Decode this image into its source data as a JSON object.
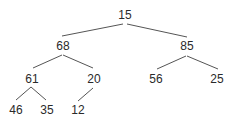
{
  "diagram": {
    "type": "binary-tree",
    "nodes": [
      {
        "id": "n15",
        "label": "15",
        "x": 125,
        "y": 15
      },
      {
        "id": "n68",
        "label": "68",
        "x": 63,
        "y": 46
      },
      {
        "id": "n85",
        "label": "85",
        "x": 187,
        "y": 46
      },
      {
        "id": "n61",
        "label": "61",
        "x": 32,
        "y": 79
      },
      {
        "id": "n20",
        "label": "20",
        "x": 94,
        "y": 79
      },
      {
        "id": "n56",
        "label": "56",
        "x": 156,
        "y": 79
      },
      {
        "id": "n25",
        "label": "25",
        "x": 217,
        "y": 79
      },
      {
        "id": "n46",
        "label": "46",
        "x": 16,
        "y": 110
      },
      {
        "id": "n35",
        "label": "35",
        "x": 47,
        "y": 110
      },
      {
        "id": "n12",
        "label": "12",
        "x": 78,
        "y": 110
      }
    ],
    "edges": [
      {
        "from": "15",
        "to": "68"
      },
      {
        "from": "15",
        "to": "85"
      },
      {
        "from": "68",
        "to": "61"
      },
      {
        "from": "68",
        "to": "20"
      },
      {
        "from": "85",
        "to": "56"
      },
      {
        "from": "85",
        "to": "25"
      },
      {
        "from": "61",
        "to": "46"
      },
      {
        "from": "61",
        "to": "35"
      },
      {
        "from": "20",
        "to": "12"
      }
    ],
    "colors": {
      "line": "#555555",
      "text": "#2a2a2a",
      "background": "#ffffff"
    }
  }
}
